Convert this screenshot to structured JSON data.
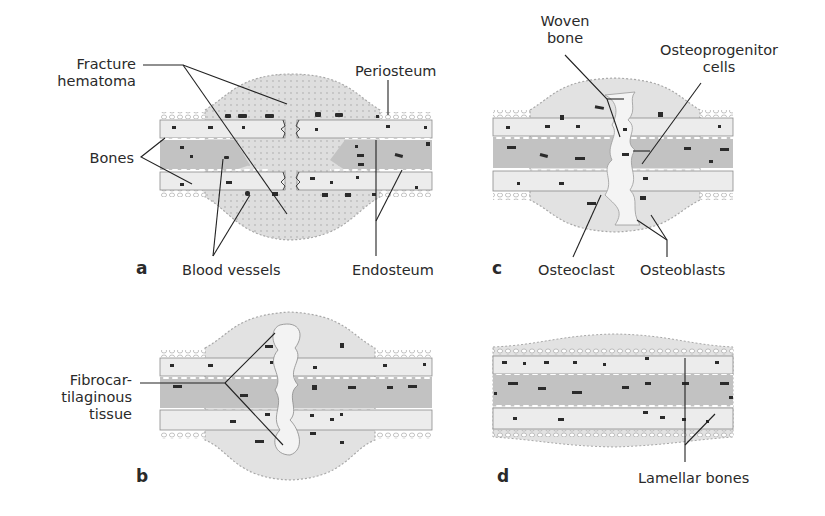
{
  "figure": {
    "colors": {
      "periosteum_fill": "#e4e4e4",
      "cortex_fill": "#e9e9e9",
      "marrow_fill": "#bdbdbd",
      "hematoma_fill": "#dcdcdc",
      "cell_dark": "#2b2b2b",
      "line": "#222222"
    },
    "panels": [
      {
        "id": "a",
        "letter": "a",
        "labels": {
          "fracture_hematoma": "Fracture\nhematoma",
          "fracture_line1": "Fracture",
          "fracture_line2": "hematoma",
          "periosteum": "Periosteum",
          "bones": "Bones",
          "blood_vessels": "Blood vessels",
          "endosteum": "Endosteum"
        }
      },
      {
        "id": "b",
        "letter": "b",
        "labels": {
          "fibro_line1": "Fibrocar-",
          "fibro_line2": "tilaginous",
          "fibro_line3": "tissue"
        }
      },
      {
        "id": "c",
        "letter": "c",
        "labels": {
          "woven_line1": "Woven",
          "woven_line2": "bone",
          "osteo_line1": "Osteoprogenitor",
          "osteo_line2": "cells",
          "osteoclast": "Osteoclast",
          "osteoblasts": "Osteoblasts"
        }
      },
      {
        "id": "d",
        "letter": "d",
        "labels": {
          "lamellar_bones": "Lamellar bones"
        }
      }
    ]
  }
}
